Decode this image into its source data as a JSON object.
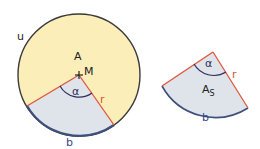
{
  "colors": {
    "circle_fill": "#fbeeb8",
    "circle_stroke": "#3a3a3a",
    "sector_fill": "#dfe3ea",
    "radius_stroke": "#e0553a",
    "arc_stroke": "#3d4f7a",
    "angle_stroke": "#2e2e5a",
    "label_color": "#222222",
    "radius_label_color": "#d9552e",
    "arc_label_color": "#2f4a8a"
  },
  "circle": {
    "label_circumference": "u",
    "label_area": "A",
    "label_center": "M",
    "label_angle": "α",
    "label_radius": "r",
    "label_arc": "b"
  },
  "sector": {
    "label_angle": "α",
    "label_radius": "r",
    "label_area_main": "A",
    "label_area_sub": "S",
    "label_arc": "b"
  }
}
